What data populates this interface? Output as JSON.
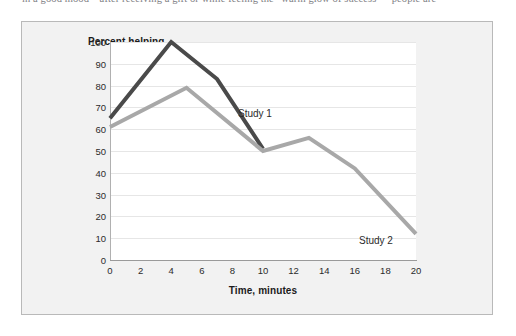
{
  "page": {
    "text_fragment": "in a good mood—after receiving a gift or while feeling the “warm glow of success”—people are"
  },
  "chart_data": {
    "type": "line",
    "title": "",
    "xlabel": "Time, minutes",
    "ylabel": "Percent helping",
    "xlim": [
      0,
      20
    ],
    "ylim": [
      0,
      100
    ],
    "xticks": [
      0,
      2,
      4,
      6,
      8,
      10,
      12,
      14,
      16,
      18,
      20
    ],
    "yticks": [
      0,
      10,
      20,
      30,
      40,
      50,
      60,
      70,
      80,
      90,
      100
    ],
    "grid": "horizontal",
    "legend_position": "inline-annotations",
    "series": [
      {
        "name": "Study 1",
        "color": "#4a4a4a",
        "label_x": 12.0,
        "label_y": 86,
        "points": [
          {
            "x": 0,
            "y": 65
          },
          {
            "x": 4,
            "y": 100
          },
          {
            "x": 7,
            "y": 83
          },
          {
            "x": 10,
            "y": 51
          }
        ]
      },
      {
        "name": "Study 2",
        "color": "#a8a8a8",
        "label_x": 16.0,
        "label_y": 24,
        "points": [
          {
            "x": 0,
            "y": 61
          },
          {
            "x": 5,
            "y": 79
          },
          {
            "x": 10,
            "y": 50
          },
          {
            "x": 13,
            "y": 56
          },
          {
            "x": 16,
            "y": 42
          },
          {
            "x": 20,
            "y": 12
          }
        ]
      }
    ],
    "colors": {
      "study_1": "#4a4a4a",
      "study_2": "#a8a8a8",
      "panel_background": "#f2f2f2",
      "panel_border": "#b9b9b9",
      "plot_background": "#ffffff",
      "gridline": "#e6e6e6",
      "axis": "#9a9a9a",
      "text": "#1b1b1b"
    }
  }
}
